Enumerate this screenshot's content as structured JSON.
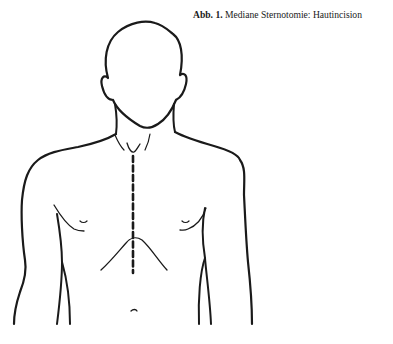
{
  "figure": {
    "caption_label": "Abb. 1.",
    "caption_text": " Mediane Sternotomie: Hautincision",
    "illustration": "upper-body-outline-with-median-sternotomy-incision-line",
    "incision_style": "dashed vertical midline",
    "line_color": "#1a1a1a",
    "background_color": "#ffffff"
  }
}
